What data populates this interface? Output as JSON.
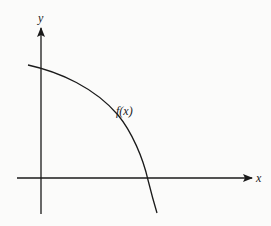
{
  "diagram": {
    "type": "function-graph",
    "axes": {
      "x_label": "x",
      "y_label": "y"
    },
    "curve": {
      "label": "f(x)",
      "description": "decreasing concave-down curve crossing positive y-axis and positive x-axis"
    },
    "colors": {
      "background": "#fbfbfa",
      "ink": "#1a1a1a"
    }
  }
}
